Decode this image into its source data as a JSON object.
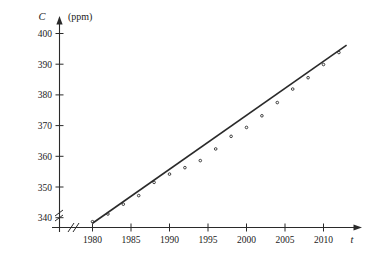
{
  "chart_data": {
    "type": "scatter",
    "title": "",
    "subtitle": "",
    "xlabel": "t",
    "ylabel": "C",
    "yunit": "(ppm)",
    "xlim": [
      1979,
      2014
    ],
    "ylim": [
      335,
      403
    ],
    "grid": false,
    "legend": null,
    "axis_break": true,
    "xticks": [
      1980,
      1985,
      1990,
      1995,
      2000,
      2005,
      2010
    ],
    "xtick_labels": [
      "1980",
      "1985",
      "1990",
      "1995",
      "2000",
      "2005",
      "2010"
    ],
    "yticks": [
      340,
      350,
      360,
      370,
      380,
      390,
      400
    ],
    "ytick_labels": [
      "340",
      "350",
      "360",
      "370",
      "380",
      "390",
      "400"
    ],
    "x": [
      1980,
      1982,
      1984,
      1986,
      1988,
      1990,
      1992,
      1994,
      1996,
      1998,
      2000,
      2002,
      2004,
      2006,
      2008,
      2010,
      2012
    ],
    "y": [
      338.7,
      341.2,
      344.4,
      347.2,
      351.5,
      354.2,
      356.3,
      358.6,
      362.4,
      366.5,
      369.4,
      373.2,
      377.5,
      381.9,
      385.6,
      389.9,
      393.8
    ],
    "series": [
      {
        "name": "CO2 concentration",
        "type": "scatter",
        "points": [
          {
            "x": 1980,
            "y": 338.7
          },
          {
            "x": 1982,
            "y": 341.2
          },
          {
            "x": 1984,
            "y": 344.4
          },
          {
            "x": 1986,
            "y": 347.2
          },
          {
            "x": 1988,
            "y": 351.5
          },
          {
            "x": 1990,
            "y": 354.2
          },
          {
            "x": 1992,
            "y": 356.3
          },
          {
            "x": 1994,
            "y": 358.6
          },
          {
            "x": 1996,
            "y": 362.4
          },
          {
            "x": 1998,
            "y": 366.5
          },
          {
            "x": 2000,
            "y": 369.4
          },
          {
            "x": 2002,
            "y": 373.2
          },
          {
            "x": 2004,
            "y": 377.5
          },
          {
            "x": 2006,
            "y": 381.9
          },
          {
            "x": 2008,
            "y": 385.6
          },
          {
            "x": 2010,
            "y": 389.9
          },
          {
            "x": 2012,
            "y": 393.8
          }
        ]
      },
      {
        "name": "regression line",
        "type": "line",
        "x_start": 1980,
        "y_start": 338.2,
        "x_end": 2013,
        "y_end": 396.2
      }
    ]
  }
}
